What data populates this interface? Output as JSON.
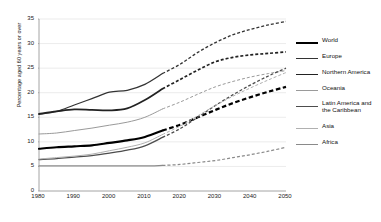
{
  "chart_data": {
    "type": "line",
    "title": "",
    "xlabel": "",
    "ylabel": "Percentage aged 60 years or over",
    "xlim": [
      1980,
      2050
    ],
    "ylim": [
      0,
      35
    ],
    "xticks": [
      1980,
      1990,
      2000,
      2010,
      2020,
      2030,
      2040,
      2050
    ],
    "yticks": [
      0,
      5,
      10,
      15,
      20,
      25,
      30,
      35
    ],
    "grid": "horizontal",
    "legend_position": "right",
    "projection_starts": 2015,
    "x": [
      1980,
      1985,
      1990,
      1995,
      2000,
      2005,
      2010,
      2015,
      2020,
      2025,
      2030,
      2035,
      2040,
      2045,
      2050
    ],
    "series": [
      {
        "name": "World",
        "color": "#000000",
        "width": 2.2,
        "values": [
          8.6,
          8.9,
          9.1,
          9.3,
          9.8,
          10.3,
          11.0,
          12.3,
          13.5,
          15.0,
          16.5,
          17.9,
          19.1,
          20.2,
          21.2
        ]
      },
      {
        "name": "Europe",
        "color": "#333333",
        "width": 1.3,
        "values": [
          15.6,
          16.2,
          17.5,
          18.8,
          20.1,
          20.5,
          21.7,
          23.9,
          25.8,
          28.2,
          30.2,
          31.8,
          32.9,
          33.8,
          34.5
        ]
      },
      {
        "name": "Northern America",
        "color": "#222222",
        "width": 1.7,
        "values": [
          15.7,
          16.2,
          16.6,
          16.5,
          16.4,
          16.8,
          18.5,
          20.8,
          22.7,
          24.6,
          26.3,
          27.2,
          27.7,
          28.0,
          28.3
        ]
      },
      {
        "name": "Oceania",
        "color": "#9a9a9a",
        "width": 1.0,
        "values": [
          11.6,
          11.8,
          12.3,
          12.8,
          13.4,
          14.0,
          15.0,
          16.7,
          18.1,
          19.7,
          21.2,
          22.3,
          23.2,
          23.9,
          24.5
        ]
      },
      {
        "name": "Latin America and the Caribbean",
        "color": "#4d4d4d",
        "width": 1.3,
        "values": [
          6.4,
          6.6,
          6.9,
          7.2,
          7.7,
          8.3,
          9.2,
          10.9,
          12.7,
          15.0,
          17.4,
          19.6,
          21.6,
          23.4,
          25.0
        ]
      },
      {
        "name": "Asia",
        "color": "#b0b0b0",
        "width": 1.0,
        "values": [
          6.5,
          6.8,
          7.1,
          7.5,
          8.2,
          8.9,
          9.8,
          11.5,
          13.2,
          15.3,
          17.4,
          19.3,
          21.0,
          22.6,
          24.1
        ]
      },
      {
        "name": "Africa",
        "color": "#8a8a8a",
        "width": 1.2,
        "values": [
          5.1,
          5.1,
          5.1,
          5.1,
          5.1,
          5.1,
          5.1,
          5.2,
          5.4,
          5.8,
          6.2,
          6.8,
          7.4,
          8.1,
          8.9
        ]
      }
    ]
  },
  "legend": {
    "items": [
      {
        "label": "World"
      },
      {
        "label": "Europe"
      },
      {
        "label": "Northern America"
      },
      {
        "label": "Oceania"
      },
      {
        "label": "Latin America and\nthe Caribbean"
      },
      {
        "label": "Asia"
      },
      {
        "label": "Africa"
      }
    ]
  }
}
